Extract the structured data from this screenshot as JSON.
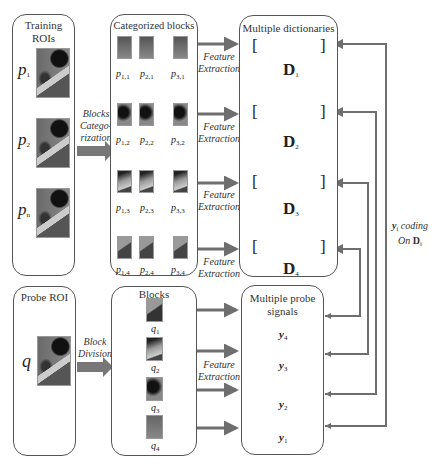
{
  "training": {
    "title_line1": "Training",
    "title_line2": "ROIs",
    "rois": [
      {
        "label": "p",
        "sub": "1"
      },
      {
        "label": "p",
        "sub": "2"
      },
      {
        "label": "p",
        "sub": "n"
      }
    ]
  },
  "categorization_arrow": {
    "line1": "Blocks",
    "line2": "Catego-",
    "line3": "rization"
  },
  "categorized": {
    "title": "Categorized blocks",
    "rows": [
      [
        "p",
        "1,1",
        "p",
        "2,1",
        "p",
        "3,1"
      ],
      [
        "p",
        "1,2",
        "p",
        "2,2",
        "p",
        "3,2"
      ],
      [
        "p",
        "1,3",
        "p",
        "2,3",
        "p",
        "3,3"
      ],
      [
        "p",
        "1,4",
        "p",
        "2,4",
        "p",
        "3,4"
      ]
    ],
    "labels": [
      [
        "1,1",
        "2,1",
        "3,1"
      ],
      [
        "1,2",
        "2,2",
        "3,2"
      ],
      [
        "1,3",
        "2,3",
        "3,3"
      ],
      [
        "1,4",
        "2,4",
        "3,4"
      ]
    ]
  },
  "feature_extraction": {
    "line1": "Feature",
    "line2": "Extraction"
  },
  "dictionaries": {
    "title": "Multiple dictionaries",
    "open_bracket": "[",
    "close_bracket": "]",
    "items": [
      {
        "letter": "D",
        "sub": "1"
      },
      {
        "letter": "D",
        "sub": "2"
      },
      {
        "letter": "D",
        "sub": "3"
      },
      {
        "letter": "D",
        "sub": "4"
      }
    ]
  },
  "probe": {
    "title": "Probe ROI",
    "label": "q"
  },
  "division_arrow": {
    "line1": "Block",
    "line2": "Division"
  },
  "blocks": {
    "title": "Blocks",
    "items": [
      {
        "label": "q",
        "sub": "1"
      },
      {
        "label": "q",
        "sub": "2"
      },
      {
        "label": "q",
        "sub": "3"
      },
      {
        "label": "q",
        "sub": "4"
      }
    ]
  },
  "probe_signals": {
    "title_line1": "Multiple probe",
    "title_line2": "signals",
    "items": [
      {
        "letter": "y",
        "sub": "4"
      },
      {
        "letter": "y",
        "sub": "3"
      },
      {
        "letter": "y",
        "sub": "2"
      },
      {
        "letter": "y",
        "sub": "1"
      }
    ]
  },
  "coding": {
    "line1_var": "y",
    "line1_sub": "i",
    "line1_text": " coding",
    "line2_text": "On ",
    "line2_var": "D",
    "line2_sub": "i"
  },
  "colors": {
    "arrow": "#6e6e6e",
    "border": "#555555"
  }
}
